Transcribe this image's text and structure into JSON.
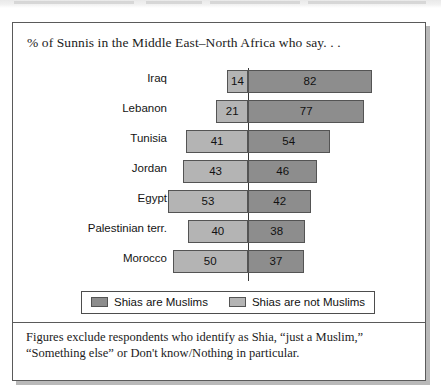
{
  "page": {
    "bleed_note": ""
  },
  "figure": {
    "title": "% of Sunnis in the Middle East–North Africa who say. . .",
    "footnote": "Figures exclude respondents who identify as Shia, “just a Muslim,” “Something else” or Don't know/Nothing in particular.",
    "colors": {
      "muslims": "#8d8d8d",
      "not_muslims": "#b4b4b4",
      "bar_border": "#545454",
      "frame": "#5a5a5a",
      "axis": "#3a3a3a"
    }
  },
  "legend": {
    "items": [
      {
        "label": "Shias are Muslims",
        "swatch": "dark"
      },
      {
        "label": "Shias are not Muslims",
        "swatch": "light"
      }
    ]
  },
  "chart_data": {
    "type": "bar",
    "orientation": "horizontal",
    "layout": "diverging",
    "title": "% of Sunnis in the Middle East–North Africa who say. . .",
    "xlabel": "",
    "ylabel": "",
    "grid": false,
    "legend_position": "bottom",
    "categories": [
      "Iraq",
      "Lebanon",
      "Tunisia",
      "Jordan",
      "Egypt",
      "Palestinian terr.",
      "Morocco"
    ],
    "series": [
      {
        "name": "Shias are not Muslims",
        "side": "left",
        "color": "#b4b4b4",
        "values": [
          14,
          21,
          41,
          43,
          53,
          40,
          50
        ]
      },
      {
        "name": "Shias are Muslims",
        "side": "right",
        "color": "#8d8d8d",
        "values": [
          82,
          77,
          54,
          46,
          42,
          38,
          37
        ]
      }
    ],
    "value_unit": "%",
    "xlim": [
      -60,
      90
    ]
  }
}
